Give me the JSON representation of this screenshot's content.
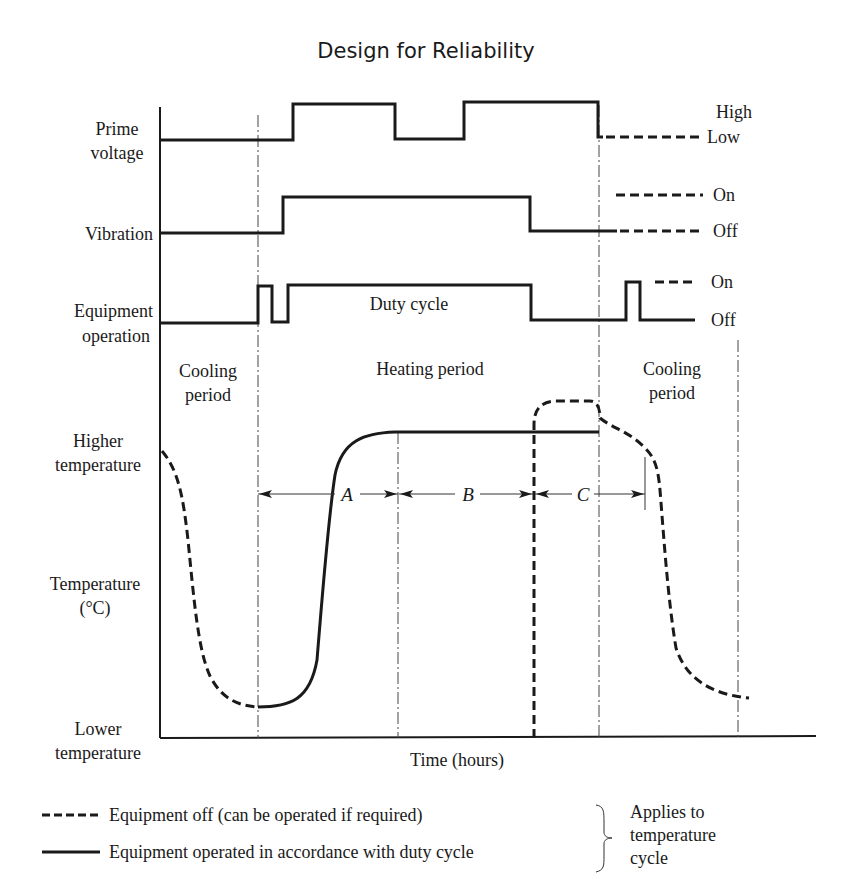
{
  "title": "Design for Reliability",
  "signals": {
    "prime_voltage": {
      "label_line1": "Prime",
      "label_line2": "voltage",
      "level_high": "High",
      "level_low": "Low"
    },
    "vibration": {
      "label": "Vibration",
      "level_on": "On",
      "level_off": "Off"
    },
    "equipment_operation": {
      "label_line1": "Equipment",
      "label_line2": "operation",
      "annotation": "Duty cycle",
      "level_on": "On",
      "level_off": "Off"
    }
  },
  "periods": {
    "cooling_left_line1": "Cooling",
    "cooling_left_line2": "period",
    "heating": "Heating period",
    "cooling_right_line1": "Cooling",
    "cooling_right_line2": "period"
  },
  "temperature_axis": {
    "higher_line1": "Higher",
    "higher_line2": "temperature",
    "title_line1": "Temperature",
    "title_line2": "(°C)",
    "lower_line1": "Lower",
    "lower_line2": "temperature"
  },
  "intervals": {
    "a": "A",
    "b": "B",
    "c": "C"
  },
  "x_axis_label": "Time (hours)",
  "legend": {
    "dashed": "Equipment off (can be operated if required)",
    "solid": "Equipment operated in accordance with duty cycle",
    "note_line1": "Applies to",
    "note_line2": "temperature",
    "note_line3": "cycle"
  }
}
